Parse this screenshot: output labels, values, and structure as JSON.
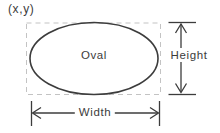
{
  "diagram": {
    "origin_label": "(x,y)",
    "shape_label": "Oval",
    "height_label": "Height",
    "width_label": "Width",
    "colors": {
      "line": "#3c3c3c",
      "dashed_box": "#c3c3c3",
      "text": "#3c3c3c",
      "background": "#ffffff"
    }
  }
}
